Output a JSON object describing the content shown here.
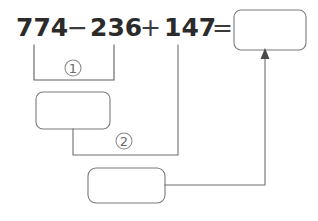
{
  "worksheet": {
    "title": "Order of operations worked example",
    "background_color": "#ffffff",
    "line_color": "#6f6f6f",
    "text_color": "#2b2b2b"
  },
  "equation": {
    "operand_1": "774",
    "operator_1": "−",
    "operand_2": "236",
    "operator_2": "+",
    "operand_3": "147",
    "equals": "=",
    "full_text": "774 − 236 + 147 ="
  },
  "steps": [
    {
      "marker": "①",
      "label": "1",
      "description": "subtraction of 774 and 236",
      "answer_value": ""
    },
    {
      "marker": "②",
      "label": "2",
      "description": "addition of step 1 result and 147",
      "answer_value": ""
    }
  ],
  "answer_boxes": [
    {
      "name": "final-answer-box",
      "value": "",
      "placeholder": ""
    },
    {
      "name": "step-1-answer-box",
      "value": "",
      "placeholder": ""
    },
    {
      "name": "step-2-answer-box",
      "value": "",
      "placeholder": ""
    }
  ]
}
